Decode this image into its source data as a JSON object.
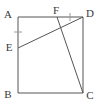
{
  "figure": {
    "name": "square-with-cevians",
    "stroke_color": "#555555",
    "label_color": "#3a3a3a",
    "background_color": "#ffffff",
    "stroke_width": 1,
    "labels": {
      "A": "A",
      "B": "B",
      "C": "C",
      "D": "D",
      "E": "E",
      "F": "F"
    },
    "label_positions": {
      "A": {
        "x": 8,
        "y": 15
      },
      "B": {
        "x": 8,
        "y": 95
      },
      "C": {
        "x": 90,
        "y": 96
      },
      "D": {
        "x": 90,
        "y": 14
      },
      "E": {
        "x": 9,
        "y": 48
      },
      "F": {
        "x": 56,
        "y": 12
      }
    },
    "points": {
      "A": {
        "x": 18,
        "y": 17
      },
      "B": {
        "x": 18,
        "y": 93
      },
      "C": {
        "x": 83,
        "y": 93
      },
      "D": {
        "x": 83,
        "y": 17
      },
      "E": {
        "x": 18,
        "y": 48
      },
      "F": {
        "x": 57,
        "y": 17
      }
    },
    "segments": [
      {
        "name": "side-AD",
        "from": "A",
        "to": "D"
      },
      {
        "name": "side-AB",
        "from": "A",
        "to": "B"
      },
      {
        "name": "side-BC",
        "from": "B",
        "to": "C"
      },
      {
        "name": "side-CD",
        "from": "C",
        "to": "D"
      },
      {
        "name": "segment-ED",
        "from": "E",
        "to": "D"
      },
      {
        "name": "segment-FC",
        "from": "F",
        "to": "C"
      }
    ],
    "tick_marks": [
      {
        "name": "tick-AE",
        "on": "AE",
        "x": 18,
        "y": 32,
        "orientation": "horizontal"
      },
      {
        "name": "tick-FD",
        "on": "FD",
        "x": 70,
        "y": 17,
        "orientation": "vertical"
      }
    ]
  }
}
